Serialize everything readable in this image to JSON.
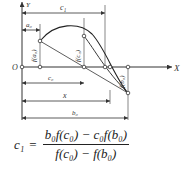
{
  "diagram": {
    "axis_x_label": "X",
    "axis_y_label": "Y",
    "origin_label": "O",
    "dimensions": {
      "c1": "c₁",
      "a0": "a₀",
      "c0": "c₀",
      "x": "x",
      "b0": "b₀"
    },
    "point_labels": {
      "f_a0": "f(a₀)",
      "f_c0": "f(c₀)",
      "f_b0": "f(b₀)"
    },
    "line_color": "#333333"
  },
  "formula": {
    "lhs": "c₁",
    "eq": "=",
    "numerator": "b₀f(c₀) − c₀f(b₀)",
    "denominator": "f(c₀) − f(b₀)"
  }
}
